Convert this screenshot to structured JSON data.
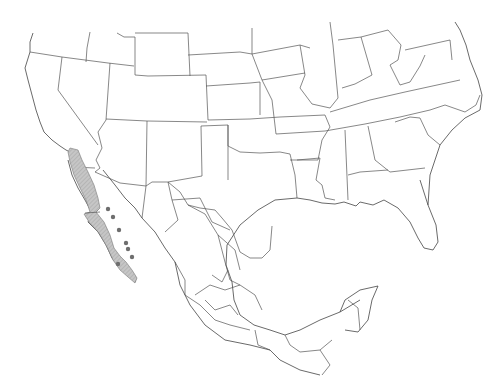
{
  "map": {
    "title": "Range map of North America (United States and Mexico)",
    "region": "Southern United States and Mexico",
    "colors": {
      "background": "#ffffff",
      "border": "#555555",
      "range_fill": "#c6c6c6",
      "range_hatch": "#9a9a9a",
      "point_marker": "#6e6e6e"
    },
    "range": {
      "label": "Baja California peninsula distribution",
      "description": "Shaded range covering the Baja California peninsula from the US-Mexico border south to Cabo San Lucas"
    },
    "point_records": {
      "label": "Occurrence points on Gulf of California islands",
      "points": [
        {
          "x": 108,
          "y": 209
        },
        {
          "x": 113,
          "y": 217
        },
        {
          "x": 119,
          "y": 230
        },
        {
          "x": 126,
          "y": 243
        },
        {
          "x": 128,
          "y": 249
        },
        {
          "x": 132,
          "y": 257
        },
        {
          "x": 118,
          "y": 264
        }
      ]
    },
    "countries": [
      "United States",
      "Mexico"
    ]
  }
}
